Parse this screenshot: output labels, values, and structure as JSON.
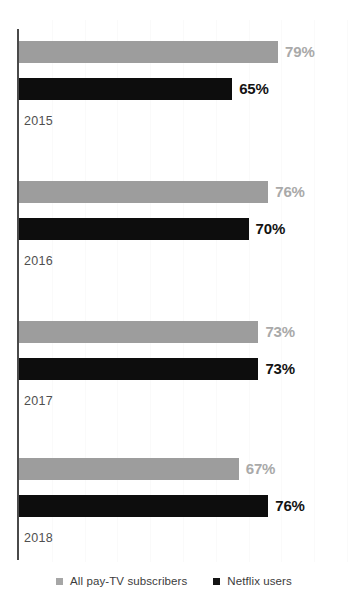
{
  "chart_data": {
    "type": "bar",
    "orientation": "horizontal",
    "title": "",
    "subtitle": "",
    "xlabel": "",
    "ylabel": "",
    "categories": [
      "2015",
      "2016",
      "2017",
      "2018"
    ],
    "series": [
      {
        "name": "All pay-TV subscribers",
        "color": "#9d9d9d",
        "values": [
          79,
          76,
          73,
          67
        ],
        "value_labels": [
          "79%",
          "76%",
          "73%",
          "67%"
        ]
      },
      {
        "name": "Netflix users",
        "color": "#0d0d0d",
        "values": [
          65,
          70,
          73,
          76
        ],
        "value_labels": [
          "65%",
          "70%",
          "73%",
          "76%"
        ]
      }
    ],
    "xlim": [
      0,
      100
    ],
    "grid": true,
    "grid_axis": "x",
    "legend_position": "bottom"
  },
  "legend": {
    "items": [
      {
        "label": "All pay-TV subscribers",
        "swatch": "series-a"
      },
      {
        "label": "Netflix users",
        "swatch": "series-b"
      }
    ]
  },
  "axis": {
    "value_axis_tick_step": 10
  }
}
